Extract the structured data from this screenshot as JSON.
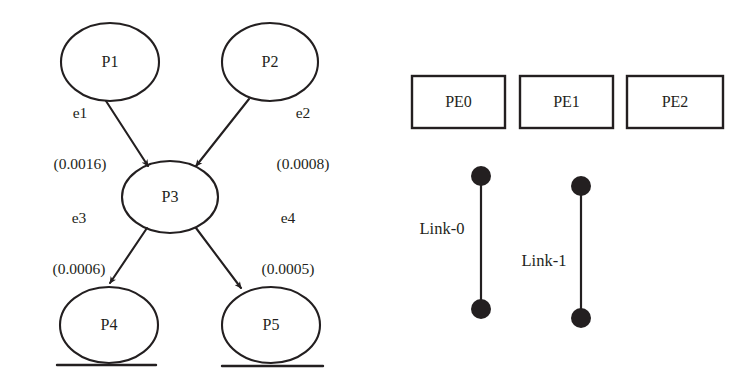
{
  "figure": {
    "stroke_color": "#231f20",
    "background": "#ffffff"
  },
  "task_graph": {
    "nodes": [
      {
        "id": "P1",
        "label": "P1",
        "cx": 110,
        "cy": 62,
        "rx": 49,
        "ry": 39
      },
      {
        "id": "P2",
        "label": "P2",
        "cx": 270,
        "cy": 62,
        "rx": 48,
        "ry": 39
      },
      {
        "id": "P3",
        "label": "P3",
        "cx": 170,
        "cy": 197,
        "rx": 48,
        "ry": 36
      },
      {
        "id": "P4",
        "label": "P4",
        "cx": 109,
        "cy": 325,
        "rx": 49,
        "ry": 38
      },
      {
        "id": "P5",
        "label": "P5",
        "cx": 271,
        "cy": 325,
        "rx": 49,
        "ry": 38
      }
    ],
    "edges": [
      {
        "id": "e1",
        "from": "P1",
        "to": "P3",
        "name": "e1",
        "weight": "(0.0016)",
        "weight_value": 0.0016,
        "label_x": 80,
        "label_y": 139
      },
      {
        "id": "e2",
        "from": "P2",
        "to": "P3",
        "name": "e2",
        "weight": "(0.0008)",
        "weight_value": 0.0008,
        "label_x": 303,
        "label_y": 139
      },
      {
        "id": "e3",
        "from": "P3",
        "to": "P4",
        "name": "e3",
        "weight": "(0.0006)",
        "weight_value": 0.0006,
        "label_x": 79,
        "label_y": 244
      },
      {
        "id": "e4",
        "from": "P3",
        "to": "P5",
        "name": "e4",
        "weight": "(0.0005)",
        "weight_value": 0.0005,
        "label_x": 288,
        "label_y": 244
      }
    ],
    "ground_lines": [
      {
        "for": "P4",
        "x1": 57,
        "x2": 156,
        "y": 365
      },
      {
        "for": "P5",
        "x1": 222,
        "x2": 323,
        "y": 366
      }
    ]
  },
  "architecture": {
    "pe_boxes": [
      {
        "id": "PE0",
        "label": "PE0",
        "x": 412,
        "y": 76,
        "w": 93,
        "h": 52
      },
      {
        "id": "PE1",
        "label": "PE1",
        "x": 520,
        "y": 76,
        "w": 93,
        "h": 52
      },
      {
        "id": "PE2",
        "label": "PE2",
        "x": 627,
        "y": 76,
        "w": 96,
        "h": 52
      }
    ],
    "links": [
      {
        "id": "Link-0",
        "label": "Link-0",
        "x": 481,
        "y_top": 176,
        "y_bottom": 309,
        "dot_radius": 10,
        "label_x": 442,
        "label_y": 229
      },
      {
        "id": "Link-1",
        "label": "Link-1",
        "x": 581,
        "y_top": 186,
        "y_bottom": 318,
        "dot_radius": 10,
        "label_x": 544,
        "label_y": 261
      }
    ]
  }
}
